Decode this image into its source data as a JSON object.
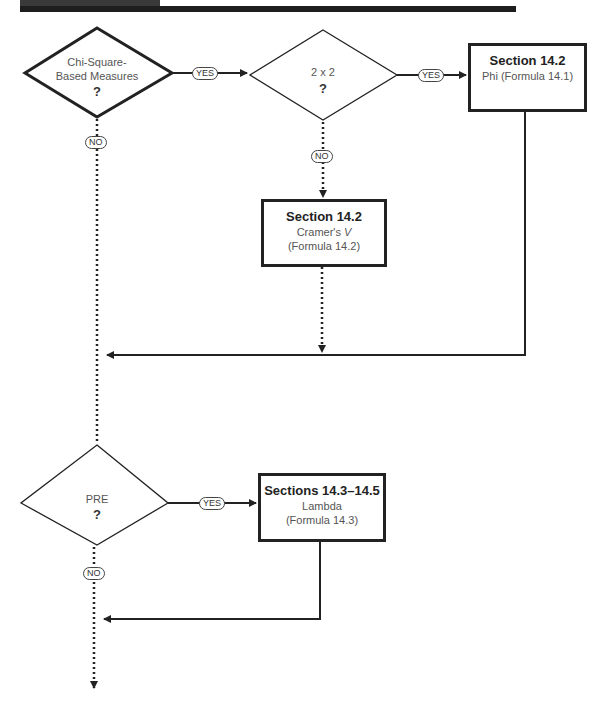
{
  "diagram": {
    "decisions": [
      {
        "id": "chi",
        "label_line1": "Chi-Square-",
        "label_line2": "Based Measures",
        "question": "?"
      },
      {
        "id": "two_by_two",
        "label": "2 x 2",
        "question": "?"
      },
      {
        "id": "pre",
        "label": "PRE",
        "question": "?"
      }
    ],
    "outcomes": [
      {
        "id": "phi",
        "title": "Section 14.2",
        "line1": "Phi (Formula 14.1)"
      },
      {
        "id": "cramer",
        "title": "Section 14.2",
        "line1_prefix": "Cramer's ",
        "line1_var": "V",
        "line2": "(Formula 14.2)"
      },
      {
        "id": "lambda",
        "title": "Sections 14.3–14.5",
        "line1": "Lambda",
        "line2": "(Formula 14.3)"
      }
    ],
    "edge_labels": {
      "chi_yes": "YES",
      "chi_no": "NO",
      "two_yes": "YES",
      "two_no": "NO",
      "pre_yes": "YES",
      "pre_no": "NO"
    },
    "colors": {
      "line": "#222222",
      "text": "#555555",
      "bar": "#1e1e1e"
    }
  }
}
